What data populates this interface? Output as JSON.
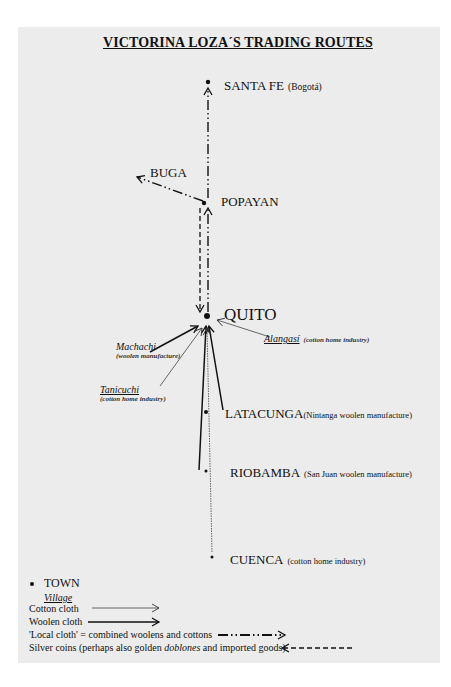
{
  "title": "VICTORINA LOZA´S TRADING ROUTES",
  "towns": [
    {
      "name": "SANTA FE",
      "note": "(Bogotá)"
    },
    {
      "name": "BUGA",
      "note": ""
    },
    {
      "name": "POPAYAN",
      "note": ""
    },
    {
      "name": "QUITO",
      "note": ""
    },
    {
      "name": "LATACUNGA",
      "note": "(Nintanga woolen manufacture)"
    },
    {
      "name": "RIOBAMBA",
      "note": "(San Juan woolen manufacture)"
    },
    {
      "name": "CUENCA",
      "note": "(cotton home industry)"
    }
  ],
  "villages": [
    {
      "name": "Machachi",
      "note": "(woolen manufacture)"
    },
    {
      "name": "Alangasí",
      "note": "(cotton home industry)"
    },
    {
      "name": "Tanicuchi",
      "note": "(cotton home industry)"
    }
  ],
  "legend": {
    "town": "TOWN",
    "village": "Village",
    "cotton": "Cotton cloth",
    "woolen": "Woolen cloth",
    "local": "'Local cloth' = combined woolens and cottons",
    "silver_pre": "Silver coins (perhaps also golden ",
    "silver_em": "doblones",
    "silver_post": " and imported goods)"
  },
  "colors": {
    "page": "#ececec",
    "ink": "#111111"
  }
}
